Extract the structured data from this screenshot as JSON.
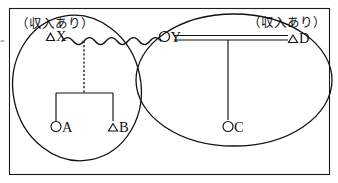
{
  "diagram": {
    "type": "family-tree",
    "frame": {
      "visible": true
    },
    "households": [
      {
        "id": "left-household",
        "annotation": "（収入あり）",
        "annotation_plain": "(収入あり)",
        "members": [
          "X",
          "A",
          "B"
        ]
      },
      {
        "id": "right-household",
        "annotation": "（収入あり）",
        "annotation_plain": "(収入あり)",
        "members": [
          "Y",
          "D",
          "C"
        ]
      }
    ],
    "persons": [
      {
        "id": "X",
        "label": "X",
        "symbol": "triangle",
        "symbol_glyph": "△",
        "display": "△X"
      },
      {
        "id": "Y",
        "label": "Y",
        "symbol": "circle",
        "symbol_glyph": "○",
        "display": "○Y"
      },
      {
        "id": "D",
        "label": "D",
        "symbol": "triangle",
        "symbol_glyph": "△",
        "display": "△D"
      },
      {
        "id": "A",
        "label": "A",
        "symbol": "circle",
        "symbol_glyph": "○",
        "display": "○A"
      },
      {
        "id": "B",
        "label": "B",
        "symbol": "triangle",
        "symbol_glyph": "△",
        "display": "△B"
      },
      {
        "id": "C",
        "label": "C",
        "symbol": "circle",
        "symbol_glyph": "○",
        "display": "○C"
      }
    ],
    "unions": [
      {
        "id": "union-x-y",
        "between": [
          "X",
          "Y"
        ],
        "line_style": "wavy",
        "meaning": "separated"
      },
      {
        "id": "union-y-d",
        "between": [
          "Y",
          "D"
        ],
        "line_style": "double",
        "meaning": "married"
      }
    ],
    "descents": [
      {
        "id": "descent-xy-children",
        "from": "union-x-y",
        "to": [
          "A",
          "B"
        ],
        "line_style": "dashed"
      },
      {
        "id": "descent-yd-child",
        "from": "union-y-d",
        "to": [
          "C"
        ],
        "line_style": "solid"
      }
    ],
    "colors": {
      "ink": "#111111",
      "frame": "#1a1a1a",
      "background": "#ffffff"
    }
  }
}
